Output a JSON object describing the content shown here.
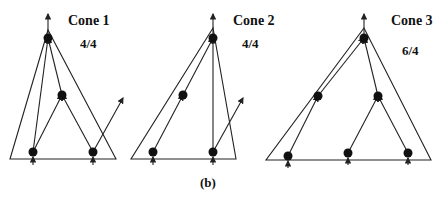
{
  "figure": {
    "panel_label": "(b)",
    "caption_partial": "FIG. 2.1 (b) ...",
    "cones": [
      {
        "title": "Cone 1",
        "ratio": "4/4",
        "triangle": [
          [
            48,
            30
          ],
          [
            10,
            159
          ],
          [
            116,
            159
          ]
        ],
        "nodes": [
          [
            48,
            38
          ],
          [
            62,
            95
          ],
          [
            33,
            152
          ],
          [
            93,
            152
          ]
        ],
        "edges": [
          [
            [
              33,
              152
            ],
            [
              48,
              38
            ]
          ],
          [
            [
              33,
              152
            ],
            [
              62,
              95
            ]
          ],
          [
            [
              93,
              152
            ],
            [
              62,
              95
            ]
          ],
          [
            [
              62,
              95
            ],
            [
              48,
              38
            ]
          ]
        ],
        "out_arrows": [
          [
            [
              48,
              38
            ],
            [
              48,
              14
            ]
          ],
          [
            [
              93,
              152
            ],
            [
              123,
              98
            ]
          ]
        ],
        "in_arrows": [
          [
            33,
            165
          ],
          [
            93,
            165
          ]
        ]
      },
      {
        "title": "Cone 2",
        "ratio": "4/4",
        "triangle": [
          [
            213,
            28
          ],
          [
            131,
            159
          ],
          [
            236,
            159
          ]
        ],
        "nodes": [
          [
            213,
            38
          ],
          [
            183,
            95
          ],
          [
            153,
            152
          ],
          [
            213,
            152
          ]
        ],
        "edges": [
          [
            [
              153,
              152
            ],
            [
              183,
              95
            ]
          ],
          [
            [
              183,
              95
            ],
            [
              213,
              38
            ]
          ],
          [
            [
              213,
              152
            ],
            [
              213,
              38
            ]
          ]
        ],
        "out_arrows": [
          [
            [
              213,
              38
            ],
            [
              213,
              14
            ]
          ],
          [
            [
              213,
              152
            ],
            [
              243,
              98
            ]
          ]
        ],
        "in_arrows": [
          [
            153,
            165
          ],
          [
            213,
            165
          ]
        ]
      },
      {
        "title": "Cone 3",
        "ratio": "6/4",
        "triangle": [
          [
            364,
            28
          ],
          [
            266,
            160
          ],
          [
            431,
            160
          ]
        ],
        "nodes": [
          [
            364,
            38
          ],
          [
            318,
            96
          ],
          [
            378,
            96
          ],
          [
            288,
            156
          ],
          [
            348,
            153
          ],
          [
            408,
            153
          ]
        ],
        "edges": [
          [
            [
              288,
              156
            ],
            [
              318,
              96
            ]
          ],
          [
            [
              318,
              96
            ],
            [
              364,
              38
            ]
          ],
          [
            [
              348,
              153
            ],
            [
              378,
              96
            ]
          ],
          [
            [
              408,
              153
            ],
            [
              378,
              96
            ]
          ],
          [
            [
              378,
              96
            ],
            [
              364,
              38
            ]
          ]
        ],
        "out_arrows": [
          [
            [
              364,
              38
            ],
            [
              364,
              14
            ]
          ]
        ],
        "in_arrows": [
          [
            288,
            168
          ],
          [
            348,
            165
          ],
          [
            408,
            165
          ]
        ]
      }
    ],
    "title_positions": [
      [
        68,
        25
      ],
      [
        233,
        25
      ],
      [
        391,
        25
      ]
    ],
    "ratio_positions": [
      [
        80,
        48
      ],
      [
        242,
        48
      ],
      [
        402,
        55
      ]
    ],
    "colors": {
      "ink": "#111111",
      "background": "#ffffff"
    }
  }
}
